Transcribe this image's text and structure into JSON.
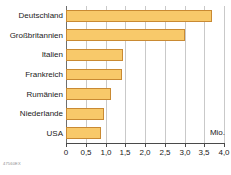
{
  "chart_data": {
    "type": "bar",
    "orientation": "horizontal",
    "title": "",
    "subtitle": "",
    "xlabel": "",
    "ylabel": "",
    "unit_label": "Mio.",
    "categories": [
      "Deutschland",
      "Großbritannien",
      "Italien",
      "Frankreich",
      "Rumänien",
      "Niederlande",
      "USA"
    ],
    "values": [
      3.7,
      3.0,
      1.45,
      1.42,
      1.15,
      0.95,
      0.88
    ],
    "xlim": [
      0,
      4.0
    ],
    "xticks": [
      0,
      0.5,
      1.0,
      1.5,
      2.0,
      2.5,
      3.0,
      3.5,
      4.0
    ],
    "xtick_labels": [
      "0",
      "0,5",
      "1,0",
      "1,5",
      "2,0",
      "2,5",
      "3,0",
      "3,5",
      "4,0"
    ],
    "grid": true,
    "grid_axis": "x",
    "legend": false,
    "bar_color": "#f8c96a",
    "bar_border_color": "#c98a33",
    "grid_color": "#c9c9c9",
    "axis_color": "#4a4a4a",
    "background_color": "#ffffff"
  },
  "source_code": "47560EX"
}
